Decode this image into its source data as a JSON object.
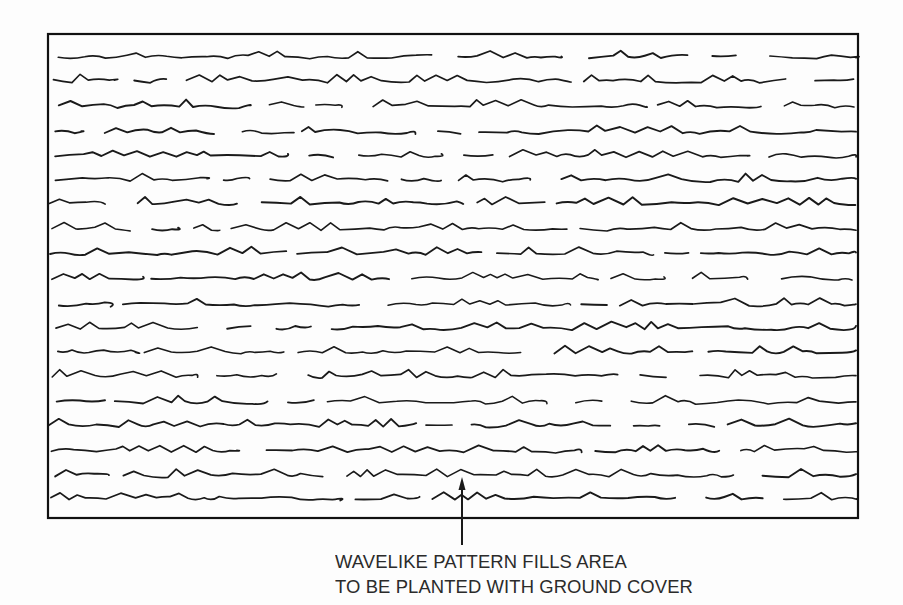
{
  "figure": {
    "kind": "landscape-architecture-hatch-symbol",
    "background_color": "#fdfdfd",
    "ink_color": "#1a1a1a",
    "frame": {
      "name": "planting-area-boundary",
      "x": 48,
      "y": 34,
      "width": 810,
      "height": 484,
      "stroke_width": 2.2,
      "stroke_color": "#111111",
      "fill": "none"
    },
    "pattern": {
      "name": "wavelike-ground-cover-hatch",
      "stroke_color": "#1a1a1a",
      "stroke_width": 1.7,
      "row_count": 19,
      "first_row_y": 57,
      "row_spacing": 24.6,
      "row_jitter": 1.6,
      "segments_per_row_min": 4,
      "segments_per_row_max": 6,
      "gap_min": 8,
      "gap_max": 34,
      "wave_amplitude": 2.2,
      "peak_height": 6.5,
      "peak_chance": 0.42
    },
    "leader": {
      "name": "caption-leader-arrow",
      "x": 462,
      "tail_y": 545,
      "head_y": 477,
      "head_width": 7,
      "head_length": 13,
      "stroke_width": 2.0,
      "stroke_color": "#1a1a1a"
    }
  },
  "caption": {
    "line1": "WAVELIKE PATTERN FILLS AREA",
    "line2": "TO BE PLANTED WITH GROUND COVER",
    "color": "#2b2b2b",
    "font_size_px": 19
  }
}
